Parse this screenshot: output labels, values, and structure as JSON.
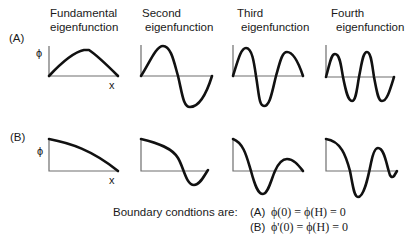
{
  "headers": [
    {
      "line1": "Fundamental",
      "line2": "eigenfunction"
    },
    {
      "line1": "Second",
      "line2": "eigenfunction"
    },
    {
      "line1": "Third",
      "line2": "eigenfunction"
    },
    {
      "line1": "Fourth",
      "line2": "eigenfunction"
    }
  ],
  "rows": [
    {
      "label": "(A)",
      "y_axis_label": "ϕ",
      "x_axis_label": "x"
    },
    {
      "label": "(B)",
      "y_axis_label": "ϕ",
      "x_axis_label": "x"
    }
  ],
  "boundary": {
    "intro": "Boundary condtions are:",
    "conditions": [
      {
        "label": "(A)",
        "equation": "ϕ(0) = ϕ(H) = 0"
      },
      {
        "label": "(B)",
        "equation": "ϕ'(0) = ϕ(H) = 0"
      }
    ]
  },
  "colors": {
    "curve": "#111111",
    "axis": "#6e6e6e",
    "background": "#ffffff"
  }
}
